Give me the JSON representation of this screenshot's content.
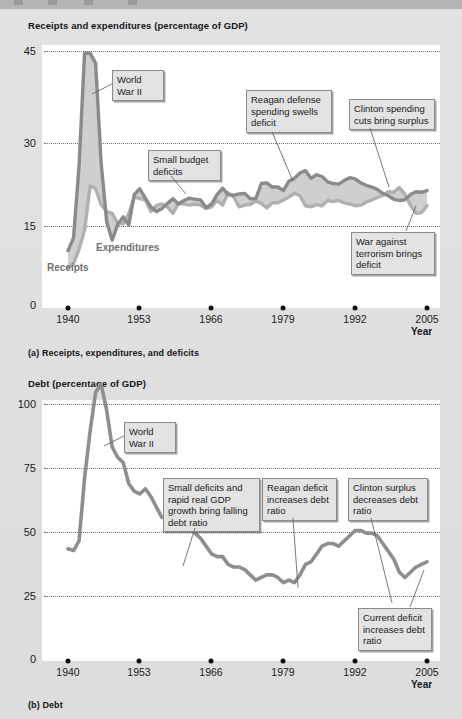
{
  "figure_a": {
    "title": "Receipts and expenditures (percentage of GDP)",
    "caption": "(a) Receipts, expenditures, and deficits",
    "axis_name": "Year",
    "y_ticks": [
      "45",
      "30",
      "15",
      "0"
    ],
    "x_ticks": [
      "1940",
      "1953",
      "1966",
      "1979",
      "1992",
      "2005"
    ],
    "series_labels": {
      "expenditures": "Expenditures",
      "receipts": "Receipts"
    },
    "callouts": [
      "World\nWar II",
      "Small budget\ndeficits",
      "Reagan defense\nspending swells\ndeficit",
      "Clinton spending\ncuts bring surplus",
      "War against\nterrorism brings\ndeficit"
    ]
  },
  "figure_b": {
    "title": "Debt (percentage of GDP)",
    "caption": "(b) Debt",
    "axis_name": "Year",
    "y_ticks": [
      "100",
      "75",
      "50",
      "25",
      "0"
    ],
    "x_ticks": [
      "1940",
      "1953",
      "1966",
      "1979",
      "1992",
      "2005"
    ],
    "callouts": [
      "World\nWar II",
      "Small deficits and\nrapid real GDP\ngrowth bring\nfalling debt ratio",
      "Reagan deficit\nincreases debt\nratio",
      "Clinton surplus\ndecreases debt\nratio",
      "Current deficit\nincreases debt\nratio"
    ]
  },
  "colors": {
    "expenditures_line": "#8a8a8a",
    "receipts_line": "#b0b0b0",
    "deficit_fill": "#cfcfcf",
    "debt_line": "#8e8e8e",
    "grid": "#6d6d6d",
    "plot_bg": "#ffffff",
    "page_bg": "#dcdcdc",
    "callout_bg": "#e3e3e3"
  },
  "chart_data": [
    {
      "type": "area",
      "title": "Receipts and expenditures (percentage of GDP)",
      "xlabel": "Year",
      "ylabel": "percentage of GDP",
      "xlim": [
        1940,
        2005
      ],
      "ylim": [
        0,
        45
      ],
      "yticks": [
        0,
        15,
        30,
        45
      ],
      "xticks": [
        1940,
        1953,
        1966,
        1979,
        1992,
        2005
      ],
      "grid": true,
      "legend": "inline-labels",
      "x": [
        1940,
        1941,
        1942,
        1943,
        1944,
        1945,
        1946,
        1947,
        1948,
        1949,
        1950,
        1951,
        1952,
        1953,
        1954,
        1955,
        1956,
        1957,
        1958,
        1959,
        1960,
        1961,
        1962,
        1963,
        1964,
        1965,
        1966,
        1967,
        1968,
        1969,
        1970,
        1971,
        1972,
        1973,
        1974,
        1975,
        1976,
        1977,
        1978,
        1979,
        1980,
        1981,
        1982,
        1983,
        1984,
        1985,
        1986,
        1987,
        1988,
        1989,
        1990,
        1991,
        1992,
        1993,
        1994,
        1995,
        1996,
        1997,
        1998,
        1999,
        2000,
        2001,
        2002,
        2003,
        2004,
        2005
      ],
      "series": [
        {
          "name": "Expenditures",
          "values": [
            9.8,
            12.0,
            24.3,
            43.6,
            43.6,
            41.9,
            24.8,
            14.8,
            11.6,
            14.3,
            15.6,
            14.2,
            19.4,
            20.4,
            18.8,
            17.3,
            16.5,
            17.0,
            17.9,
            18.7,
            17.8,
            18.4,
            18.8,
            18.6,
            18.5,
            17.2,
            17.8,
            19.4,
            20.5,
            19.4,
            19.3,
            19.5,
            19.6,
            18.7,
            18.7,
            21.3,
            21.4,
            20.7,
            20.7,
            20.1,
            21.7,
            22.2,
            23.1,
            23.5,
            22.2,
            22.8,
            22.5,
            21.6,
            21.3,
            21.2,
            21.8,
            22.3,
            22.1,
            21.4,
            21.0,
            20.7,
            20.3,
            19.6,
            19.2,
            18.6,
            18.4,
            18.5,
            19.4,
            19.9,
            19.8,
            20.1
          ]
        },
        {
          "name": "Receipts",
          "values": [
            6.8,
            7.6,
            10.1,
            13.3,
            20.9,
            20.4,
            17.7,
            16.5,
            16.2,
            14.5,
            14.4,
            16.1,
            19.0,
            18.7,
            18.5,
            16.5,
            17.5,
            17.8,
            17.3,
            16.2,
            17.9,
            17.8,
            17.6,
            17.8,
            17.6,
            17.0,
            17.3,
            18.4,
            17.6,
            19.7,
            19.0,
            17.3,
            17.6,
            17.7,
            18.3,
            17.9,
            17.1,
            18.0,
            18.0,
            18.5,
            19.0,
            19.6,
            19.2,
            17.5,
            17.3,
            17.7,
            17.5,
            18.4,
            18.2,
            18.4,
            18.0,
            17.8,
            17.5,
            17.6,
            18.1,
            18.5,
            18.9,
            19.3,
            19.9,
            19.8,
            20.6,
            19.5,
            17.6,
            16.2,
            16.3,
            17.5
          ]
        }
      ],
      "annotations": [
        {
          "text": "World War II",
          "x": 1944
        },
        {
          "text": "Small budget deficits",
          "x": 1967
        },
        {
          "text": "Reagan defense spending swells deficit",
          "x": 1984
        },
        {
          "text": "Clinton spending cuts bring surplus",
          "x": 1999
        },
        {
          "text": "War against terrorism brings deficit",
          "x": 2004
        }
      ]
    },
    {
      "type": "line",
      "title": "Debt (percentage of GDP)",
      "xlabel": "Year",
      "ylabel": "percentage of GDP",
      "xlim": [
        1940,
        2005
      ],
      "ylim": [
        0,
        100
      ],
      "yticks": [
        0,
        25,
        50,
        75,
        100
      ],
      "xticks": [
        1940,
        1953,
        1966,
        1979,
        1992,
        2005
      ],
      "grid": true,
      "x": [
        1940,
        1941,
        1942,
        1943,
        1944,
        1945,
        1946,
        1947,
        1948,
        1949,
        1950,
        1951,
        1952,
        1953,
        1954,
        1955,
        1956,
        1957,
        1958,
        1959,
        1960,
        1961,
        1962,
        1963,
        1964,
        1965,
        1966,
        1967,
        1968,
        1969,
        1970,
        1971,
        1972,
        1973,
        1974,
        1975,
        1976,
        1977,
        1978,
        1979,
        1980,
        1981,
        1982,
        1983,
        1984,
        1985,
        1986,
        1987,
        1988,
        1989,
        1990,
        1991,
        1992,
        1993,
        1994,
        1995,
        1996,
        1997,
        1998,
        1999,
        2000,
        2001,
        2002,
        2003,
        2004,
        2005
      ],
      "series": [
        {
          "name": "Debt",
          "values": [
            43.0,
            42.3,
            46.0,
            70.0,
            88.0,
            103.0,
            106.0,
            96.0,
            82.0,
            78.0,
            76.0,
            68.0,
            65.0,
            64.0,
            66.0,
            63.0,
            59.0,
            55.0,
            56.0,
            56.0,
            53.0,
            52.0,
            51.0,
            49.0,
            47.0,
            44.0,
            41.0,
            40.0,
            40.0,
            37.0,
            36.0,
            36.0,
            35.0,
            33.0,
            31.0,
            32.0,
            33.0,
            33.0,
            32.0,
            30.0,
            31.0,
            30.0,
            33.0,
            37.0,
            38.0,
            41.0,
            44.0,
            45.0,
            45.0,
            44.0,
            46.0,
            48.0,
            50.0,
            50.0,
            49.0,
            49.0,
            48.0,
            45.0,
            42.0,
            39.0,
            34.0,
            32.0,
            34.0,
            36.0,
            37.0,
            38.0
          ]
        }
      ],
      "annotations": [
        {
          "text": "World War II",
          "x": 1946
        },
        {
          "text": "Small deficits and rapid real GDP growth bring falling debt ratio",
          "x": 1965
        },
        {
          "text": "Reagan deficit increases debt ratio",
          "x": 1983
        },
        {
          "text": "Clinton surplus decreases debt ratio",
          "x": 1998
        },
        {
          "text": "Current deficit increases debt ratio",
          "x": 2004
        }
      ]
    }
  ]
}
